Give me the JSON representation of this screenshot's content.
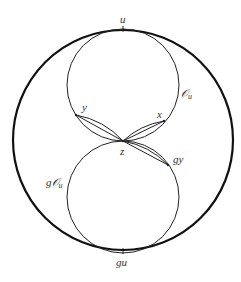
{
  "diagram": {
    "outer_circle": {
      "cx": 123,
      "cy": 140,
      "r": 110,
      "stroke_width": 2.2
    },
    "upper_circle": {
      "cx": 123,
      "cy": 85,
      "r": 56,
      "label": "𝒪u"
    },
    "lower_circle": {
      "cx": 123,
      "cy": 196,
      "r": 56,
      "label": "g𝒪u"
    },
    "points": {
      "u": {
        "x": 123,
        "y": 29,
        "label": "u"
      },
      "gu": {
        "x": 123,
        "y": 251,
        "label": "gu"
      },
      "z": {
        "x": 123,
        "y": 141,
        "label": "z"
      },
      "x": {
        "x": 164,
        "y": 121,
        "label": "x"
      },
      "y": {
        "x": 76,
        "y": 115,
        "label": "y"
      },
      "gy": {
        "x": 168,
        "y": 165,
        "label": "gy"
      }
    },
    "labels": {
      "u": "u",
      "gu": "gu",
      "z": "z",
      "x": "x",
      "y": "y",
      "gy": "gy",
      "O_u_main": "𝒪",
      "O_u_sub": "u",
      "gO_u_main": "g𝒪",
      "gO_u_sub": "u"
    }
  }
}
